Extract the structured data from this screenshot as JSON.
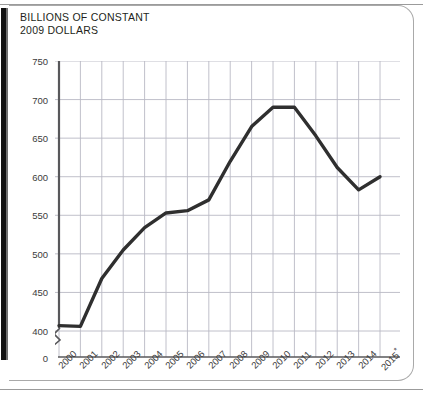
{
  "figure": {
    "title": "BILLIONS OF CONSTANT\n2009 DOLLARS",
    "line_color": "#2f2f2f",
    "grid_color": "#b9b9c4",
    "axis_color": "#58585b"
  },
  "chart_data": {
    "type": "line",
    "title": "BILLIONS OF CONSTANT 2009 DOLLARS",
    "xlabel": "",
    "ylabel": "BILLIONS OF CONSTANT 2009 DOLLARS",
    "grid": true,
    "legend": null,
    "axis_break": true,
    "ylim": [
      400,
      750
    ],
    "yticks": [
      0,
      400,
      450,
      500,
      550,
      600,
      650,
      700,
      750
    ],
    "ytick_labels": [
      "0",
      "400",
      "450",
      "500",
      "550",
      "600",
      "650",
      "700",
      "750"
    ],
    "categories": [
      "2000",
      "2001",
      "2002",
      "2003",
      "2004",
      "2005",
      "2006",
      "2007",
      "2008",
      "2009",
      "2010",
      "2011",
      "2012",
      "2013",
      "2014",
      "2015*"
    ],
    "values": [
      407,
      406,
      468,
      505,
      534,
      553,
      556,
      570,
      620,
      665,
      690,
      690,
      653,
      612,
      583,
      600
    ]
  }
}
